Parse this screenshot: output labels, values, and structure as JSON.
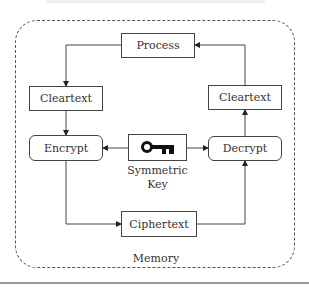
{
  "diagram": {
    "container_label": "Memory",
    "nodes": {
      "process": "Process",
      "cleartext_left": "Cleartext",
      "encrypt": "Encrypt",
      "key_label_line1": "Symmetric",
      "key_label_line2": "Key",
      "decrypt": "Decrypt",
      "cleartext_right": "Cleartext",
      "ciphertext": "Ciphertext"
    },
    "key_icon": "key-icon",
    "edges": [
      {
        "from": "Process",
        "to": "Cleartext (left)"
      },
      {
        "from": "Cleartext (left)",
        "to": "Encrypt"
      },
      {
        "from": "Symmetric Key",
        "to": "Encrypt"
      },
      {
        "from": "Symmetric Key",
        "to": "Decrypt"
      },
      {
        "from": "Encrypt",
        "to": "Ciphertext"
      },
      {
        "from": "Ciphertext",
        "to": "Decrypt"
      },
      {
        "from": "Decrypt",
        "to": "Cleartext (right)"
      },
      {
        "from": "Cleartext (right)",
        "to": "Process"
      }
    ],
    "colors": {
      "stroke": "#444444",
      "text": "#333333",
      "rule": "#9a9a9a"
    }
  }
}
